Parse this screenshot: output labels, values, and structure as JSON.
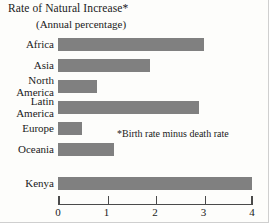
{
  "chart_data": {
    "type": "bar",
    "orientation": "horizontal",
    "title": "Rate of Natural Increase*",
    "subtitle": "(Annual percentage)",
    "footnote": "*Birth rate minus death rate",
    "xlabel": "",
    "ylabel": "",
    "xlim": [
      0,
      4
    ],
    "grid": false,
    "legend": null,
    "bar_color": "#808080",
    "axis_color": "#4a4a4a",
    "tick_labels": [
      "0",
      "1",
      "2",
      "3",
      "4"
    ],
    "tick_values": [
      0,
      1,
      2,
      3,
      4
    ],
    "categories": [
      "Africa",
      "Asia",
      "North America",
      "Latin America",
      "Europe",
      "Oceania",
      "Kenya"
    ],
    "category_lines": [
      [
        "Africa"
      ],
      [
        "Asia"
      ],
      [
        "North",
        "America"
      ],
      [
        "Latin",
        "America"
      ],
      [
        "Europe"
      ],
      [
        "Oceania"
      ],
      [
        "Kenya"
      ]
    ],
    "values": [
      3.0,
      1.9,
      0.8,
      2.9,
      0.5,
      1.15,
      4.0
    ]
  }
}
